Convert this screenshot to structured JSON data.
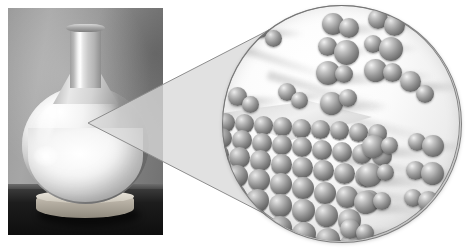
{
  "figure": {
    "caption": "",
    "background_color": "#ffffff",
    "width": 473,
    "height": 250
  },
  "photo": {
    "subject": "round-bottom glass flask containing a white solid",
    "alt_text": "Photograph of a round-bottomed glass flask filled with a pale white solid, resting on a cork ring on a dark table",
    "background_color": "#8f8f8f",
    "parts": [
      {
        "name": "flask-neck",
        "label": "neck"
      },
      {
        "name": "flask-neck-lip",
        "label": "lip"
      },
      {
        "name": "flask-bulb",
        "label": "bulb"
      },
      {
        "name": "solid-sample",
        "label": "white solid"
      },
      {
        "name": "cork-ring",
        "label": "cork ring base"
      },
      {
        "name": "table-surface",
        "label": "dark table"
      }
    ]
  },
  "pointer": {
    "name": "magnifier-cone",
    "apex": {
      "x": 88,
      "y": 123
    },
    "fill_color": "#d9d9d9",
    "stroke_color": "#8d8d8d"
  },
  "magnifier": {
    "name": "molecular-view",
    "alt_text": "Magnified molecular-scale view showing a crystalline solid surface at lower left with diatomic molecules in the gas phase above it",
    "center": {
      "x": 341,
      "y": 123
    },
    "radius": 118,
    "background_color": "#fbfbfb",
    "rim_color": "#6e6e6e",
    "atom_color": "#8c8c8c",
    "atom_highlight_color": "#f2f2f2",
    "atom_shadow_color": "#4a4a4a",
    "contents": [
      {
        "name": "crystal-lattice",
        "label": "crystalline solid surface"
      },
      {
        "name": "gas-molecules",
        "label": "diatomic gas molecules"
      }
    ]
  },
  "lattice": {
    "rows": [
      {
        "count": 9,
        "size": 19,
        "left": 2,
        "top": 0,
        "gap": -2
      },
      {
        "count": 9,
        "size": 20,
        "left": -2,
        "top": 15,
        "gap": -2
      },
      {
        "count": 8,
        "size": 21,
        "left": -6,
        "top": 31,
        "gap": -2
      },
      {
        "count": 8,
        "size": 22,
        "left": -10,
        "top": 48,
        "gap": -2
      },
      {
        "count": 7,
        "size": 23,
        "left": -14,
        "top": 66,
        "gap": -2
      },
      {
        "count": 7,
        "size": 24,
        "left": -18,
        "top": 85,
        "gap": -3
      },
      {
        "count": 6,
        "size": 25,
        "left": -22,
        "top": 105,
        "gap": -3
      }
    ]
  },
  "molecules": [
    {
      "name": "molecule-1",
      "x": 30,
      "y": 16,
      "a1": 17,
      "a2": 17,
      "dx": 13,
      "dy": 9
    },
    {
      "name": "molecule-2",
      "x": 100,
      "y": 8,
      "a1": 22,
      "a2": 20,
      "dx": 17,
      "dy": 5
    },
    {
      "name": "molecule-3",
      "x": 146,
      "y": 4,
      "a1": 20,
      "a2": 21,
      "dx": 16,
      "dy": 6
    },
    {
      "name": "molecule-4",
      "x": 96,
      "y": 32,
      "a1": 19,
      "a2": 25,
      "dx": 16,
      "dy": 3
    },
    {
      "name": "molecule-5",
      "x": 142,
      "y": 30,
      "a1": 18,
      "a2": 24,
      "dx": 15,
      "dy": 2
    },
    {
      "name": "molecule-6",
      "x": 94,
      "y": 56,
      "a1": 24,
      "a2": 18,
      "dx": 19,
      "dy": 4
    },
    {
      "name": "molecule-7",
      "x": 142,
      "y": 54,
      "a1": 23,
      "a2": 19,
      "dx": 19,
      "dy": 4
    },
    {
      "name": "molecule-8",
      "x": 6,
      "y": 82,
      "a1": 19,
      "a2": 17,
      "dx": 14,
      "dy": 9
    },
    {
      "name": "molecule-9",
      "x": 56,
      "y": 78,
      "a1": 18,
      "a2": 17,
      "dx": 13,
      "dy": 9
    },
    {
      "name": "molecule-10",
      "x": 98,
      "y": 84,
      "a1": 23,
      "a2": 18,
      "dx": 19,
      "dy": -3
    },
    {
      "name": "molecule-11",
      "x": 178,
      "y": 66,
      "a1": 21,
      "a2": 18,
      "dx": 16,
      "dy": 14
    },
    {
      "name": "molecule-12",
      "x": 140,
      "y": 130,
      "a1": 23,
      "a2": 17,
      "dx": 19,
      "dy": 2
    },
    {
      "name": "molecule-13",
      "x": 186,
      "y": 128,
      "a1": 18,
      "a2": 22,
      "dx": 14,
      "dy": 2
    },
    {
      "name": "molecule-14",
      "x": 136,
      "y": 158,
      "a1": 24,
      "a2": 17,
      "dx": 19,
      "dy": 1
    },
    {
      "name": "molecule-15",
      "x": 184,
      "y": 156,
      "a1": 19,
      "a2": 23,
      "dx": 15,
      "dy": 1
    },
    {
      "name": "molecule-16",
      "x": 132,
      "y": 186,
      "a1": 23,
      "a2": 18,
      "dx": 19,
      "dy": 1
    },
    {
      "name": "molecule-17",
      "x": 182,
      "y": 184,
      "a1": 18,
      "a2": 21,
      "dx": 14,
      "dy": 2
    },
    {
      "name": "molecule-18",
      "x": 118,
      "y": 214,
      "a1": 20,
      "a2": 18,
      "dx": 16,
      "dy": 5
    }
  ],
  "beams": [
    {
      "x": 18,
      "y": 40,
      "w": 96,
      "h": 7,
      "rot": 18
    },
    {
      "x": 46,
      "y": 66,
      "w": 120,
      "h": 8,
      "rot": 16
    },
    {
      "x": 8,
      "y": 96,
      "w": 90,
      "h": 7,
      "rot": 12
    },
    {
      "x": 104,
      "y": 104,
      "w": 110,
      "h": 9,
      "rot": 14
    },
    {
      "x": 120,
      "y": 150,
      "w": 100,
      "h": 8,
      "rot": 10
    },
    {
      "x": 124,
      "y": 182,
      "w": 96,
      "h": 8,
      "rot": 8
    }
  ]
}
